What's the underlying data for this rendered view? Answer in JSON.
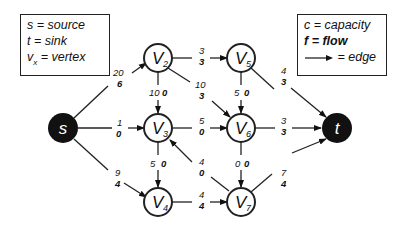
{
  "legend_left": {
    "lines": [
      {
        "sym": "s",
        "text": " = source"
      },
      {
        "sym": "t",
        "text": " = sink"
      },
      {
        "sym": "v",
        "sub": "x",
        "text": " = vertex"
      }
    ]
  },
  "legend_right": {
    "capacity": "c = capacity",
    "flow": "f = flow",
    "edge": "= edge"
  },
  "nodes": {
    "s": {
      "label": "s"
    },
    "t": {
      "label": "t"
    },
    "v2": {
      "label": "V",
      "sub": "2"
    },
    "v3": {
      "label": "V",
      "sub": "3"
    },
    "v4": {
      "label": "V",
      "sub": "4"
    },
    "v5": {
      "label": "V",
      "sub": "5"
    },
    "v6": {
      "label": "V",
      "sub": "6"
    },
    "v7": {
      "label": "V",
      "sub": "7"
    }
  },
  "edges": {
    "s_v2": {
      "c": "20",
      "f": "6"
    },
    "s_v3": {
      "c": "1",
      "f": "0"
    },
    "s_v4": {
      "c": "9",
      "f": "4"
    },
    "v2_v3": {
      "c": "10",
      "f": "0"
    },
    "v2_v5": {
      "c": "3",
      "f": "3"
    },
    "v2_v6": {
      "c": "10",
      "f": "3"
    },
    "v3_v4": {
      "c": "5",
      "f": "0"
    },
    "v3_v6": {
      "c": "5",
      "f": "0"
    },
    "v7_v3": {
      "c": "4",
      "f": "0"
    },
    "v4_v7": {
      "c": "4",
      "f": "4"
    },
    "v5_v6": {
      "c": "5",
      "f": "0"
    },
    "v5_t": {
      "c": "4",
      "f": "3"
    },
    "v6_t": {
      "c": "3",
      "f": "3"
    },
    "v6_v7": {
      "c": "0",
      "f": "0"
    },
    "v7_t": {
      "c": "7",
      "f": "4"
    }
  }
}
